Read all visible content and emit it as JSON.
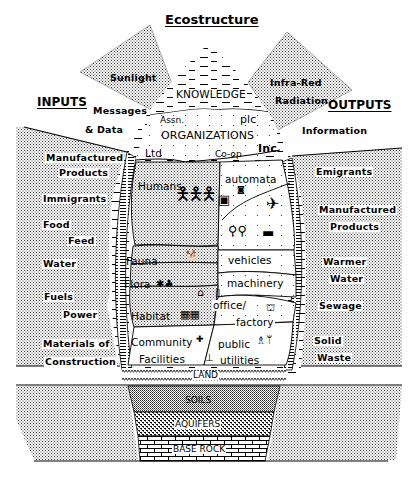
{
  "title": "Ecostructure",
  "sections": {
    "inputs_heading": "INPUTS",
    "outputs_heading": "OUTPUTS"
  },
  "inputs": {
    "sunlight": "Sunlight",
    "messages": "Messages",
    "data": "& Data",
    "manufactured_1": "Manufactured",
    "manufactured_2": "Products",
    "immigrants": "Immigrants",
    "food": "Food",
    "feed": "Feed",
    "water": "Water",
    "fuels": "Fuels",
    "power": "Power",
    "materials_1": "Materials of",
    "materials_2": "Construction"
  },
  "outputs": {
    "infrared_1": "Infra-Red",
    "infrared_2": "Radiation",
    "information": "Information",
    "emigrants": "Emigrants",
    "manufactured_1": "Manufactured",
    "manufactured_2": "Products",
    "warmer_1": "Warmer",
    "warmer_2": "Water",
    "sewage": "Sewage",
    "solid_1": "Solid",
    "solid_2": "Waste"
  },
  "core": {
    "knowledge": "KNOWLEDGE",
    "organizations": {
      "label": "ORGANIZATIONS",
      "assn": "Assn.",
      "plc": "plc",
      "ltd": "Ltd",
      "coop": "Co-op",
      "inc": "Inc"
    },
    "humans": "Humans",
    "automata": "automata",
    "fauna": "Fauna",
    "vehicles": "vehicles",
    "flora": "Flora",
    "machinery": "machinery",
    "habitat": "Habitat",
    "office": "office/",
    "factory": "factory",
    "community_1": "Community",
    "community_2": "Facilities",
    "public_1": "public",
    "public_2": "utilities"
  },
  "ground": {
    "land": "LAND",
    "soils": "SOILS",
    "aquifers": "AQUIFERS",
    "base_rock": "BASE ROCK"
  },
  "icons": {
    "humans": "person-figures",
    "automata": "computer-robot",
    "aircraft": "airplane",
    "bicycle": "bicycle",
    "car": "car",
    "fauna": "animal",
    "flora": "plant-tree",
    "machinery": "gear",
    "habitat": "house-buildings",
    "office": "office-building",
    "factory": "factory",
    "community": "cross",
    "utilities": "power-pylon"
  },
  "colors": {
    "ink": "#000000",
    "paper": "#ffffff"
  }
}
